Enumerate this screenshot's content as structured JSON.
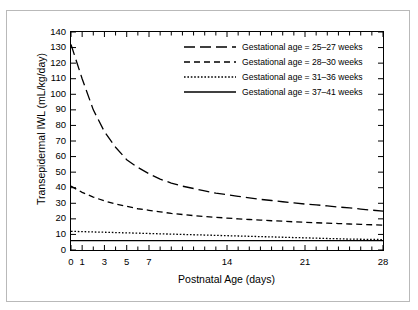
{
  "figure": {
    "background": "#ffffff",
    "frame_color": "#b9b9b9",
    "line_color": "#000000"
  },
  "chart_data": {
    "type": "line",
    "title": "",
    "xlabel": "Postnatal Age (days)",
    "ylabel": "Transepidermal IWL (mL/kg/day)",
    "xlim": [
      0,
      28
    ],
    "ylim": [
      0,
      140
    ],
    "xticks": [
      0,
      1,
      2,
      3,
      4,
      5,
      6,
      7,
      8,
      9,
      10,
      11,
      12,
      13,
      14,
      15,
      16,
      17,
      18,
      19,
      20,
      21,
      22,
      23,
      24,
      25,
      26,
      27,
      28
    ],
    "xtick_labels": [
      "0",
      "1",
      "",
      "3",
      "",
      "5",
      "",
      "7",
      "",
      "",
      "",
      "",
      "",
      "",
      "14",
      "",
      "",
      "",
      "",
      "",
      "",
      "21",
      "",
      "",
      "",
      "",
      "",
      "",
      "28"
    ],
    "yticks": [
      0,
      10,
      20,
      30,
      40,
      50,
      60,
      70,
      80,
      90,
      100,
      110,
      120,
      130,
      140
    ],
    "ytick_labels": [
      "0",
      "10",
      "20",
      "30",
      "40",
      "50",
      "60",
      "70",
      "80",
      "90",
      "100",
      "110",
      "120",
      "130",
      "140"
    ],
    "grid": false,
    "legend_position": "upper right",
    "x": [
      0,
      1,
      2,
      3,
      4,
      5,
      6,
      7,
      8,
      9,
      10,
      11,
      12,
      13,
      14,
      15,
      16,
      17,
      18,
      19,
      20,
      21,
      22,
      23,
      24,
      25,
      26,
      27,
      28
    ],
    "series": [
      {
        "name": "Gestational age = 25–27 weeks",
        "dash": "long-dash",
        "values": [
          132,
          110,
          90,
          76,
          66,
          58,
          53,
          49,
          45.5,
          43,
          41,
          39.5,
          38,
          36.5,
          35.5,
          34.5,
          33.5,
          32.5,
          31.8,
          31,
          30.2,
          29.5,
          29,
          28.3,
          27.6,
          27,
          26.3,
          25.6,
          25
        ]
      },
      {
        "name": "Gestational age = 28–30 weeks",
        "dash": "medium-dash",
        "values": [
          41,
          37,
          34,
          31.5,
          29.5,
          28,
          26.5,
          25.5,
          24.5,
          23.5,
          22.8,
          22.1,
          21.5,
          21,
          20.5,
          20,
          19.6,
          19.2,
          18.8,
          18.5,
          18.1,
          17.8,
          17.5,
          17.2,
          17,
          16.7,
          16.5,
          16.2,
          16
        ]
      },
      {
        "name": "Gestational age = 31–36 weeks",
        "dash": "dotted",
        "values": [
          12,
          11.8,
          11.6,
          11.4,
          11.2,
          11,
          10.8,
          10.6,
          10.4,
          10.2,
          10,
          9.8,
          9.6,
          9.4,
          9.2,
          9,
          8.8,
          8.6,
          8.4,
          8.2,
          8,
          7.8,
          7.6,
          7.4,
          7.2,
          7,
          6.9,
          6.8,
          6.7
        ]
      },
      {
        "name": "Gestational age = 37–41 weeks",
        "dash": "solid",
        "values": [
          6,
          6,
          6,
          6,
          6,
          6,
          6,
          6,
          6,
          6,
          6,
          6,
          6,
          6,
          6,
          6,
          6,
          6,
          6,
          6,
          6,
          6,
          6,
          6,
          6,
          6,
          6,
          6,
          6
        ]
      }
    ]
  },
  "legend": {
    "items": [
      {
        "label": "Gestational age = 25–27 weeks",
        "dash": "long-dash"
      },
      {
        "label": "Gestational age = 28–30 weeks",
        "dash": "medium-dash"
      },
      {
        "label": "Gestational age = 31–36 weeks",
        "dash": "dotted"
      },
      {
        "label": "Gestational age = 37–41 weeks",
        "dash": "solid"
      }
    ]
  }
}
